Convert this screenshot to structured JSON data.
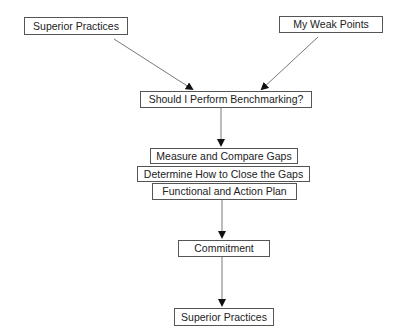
{
  "diagram": {
    "type": "flowchart",
    "nodes": [
      {
        "id": "superior_top",
        "label": "Superior Practices"
      },
      {
        "id": "weak_points",
        "label": "My Weak Points"
      },
      {
        "id": "should_benchmark",
        "label": "Should I Perform Benchmarking?"
      },
      {
        "id": "measure",
        "label": "Measure and Compare Gaps"
      },
      {
        "id": "determine",
        "label": "Determine How to Close the Gaps"
      },
      {
        "id": "functional",
        "label": "Functional and Action Plan"
      },
      {
        "id": "commitment",
        "label": "Commitment"
      },
      {
        "id": "superior_bottom",
        "label": "Superior Practices"
      }
    ],
    "edges": [
      {
        "from": "superior_top",
        "to": "should_benchmark"
      },
      {
        "from": "weak_points",
        "to": "should_benchmark"
      },
      {
        "from": "should_benchmark",
        "to": "measure"
      },
      {
        "from": "functional",
        "to": "commitment"
      },
      {
        "from": "commitment",
        "to": "superior_bottom"
      }
    ],
    "colors": {
      "line": "#444444",
      "border": "#555555",
      "text": "#222222",
      "background": "#ffffff"
    }
  }
}
